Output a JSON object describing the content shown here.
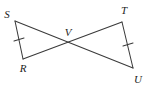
{
  "figure": {
    "type": "geometry-diagram",
    "background_color": "#ffffff",
    "stroke_color": "#3a3a3a",
    "label_color": "#1d1d1d",
    "labels": {
      "s": "S",
      "t": "T",
      "v": "V",
      "r": "R",
      "u": "U"
    },
    "points": {
      "S": {
        "x": 15,
        "y": 21
      },
      "T": {
        "x": 122,
        "y": 22
      },
      "V": {
        "x": 72,
        "y": 43
      },
      "R": {
        "x": 23,
        "y": 59
      },
      "U": {
        "x": 133,
        "y": 68
      }
    },
    "label_positions": {
      "S": {
        "x": 8,
        "y": 17
      },
      "T": {
        "x": 123,
        "y": 14
      },
      "V": {
        "x": 64,
        "y": 35
      },
      "R": {
        "x": 20,
        "y": 72
      },
      "U": {
        "x": 135,
        "y": 83
      }
    },
    "segments": [
      {
        "name": "segment-SR",
        "from": "S",
        "to": "R",
        "ticks": 1
      },
      {
        "name": "segment-TU",
        "from": "T",
        "to": "U",
        "ticks": 1
      },
      {
        "name": "segment-SU",
        "from": "S",
        "to": "U",
        "ticks": 0
      },
      {
        "name": "segment-TR",
        "from": "T",
        "to": "R",
        "ticks": 0
      }
    ],
    "tick_marks": [
      {
        "name": "tick-SR",
        "on": "segment-SR",
        "x": 19,
        "y": 40
      },
      {
        "name": "tick-TU",
        "on": "segment-TU",
        "x": 128,
        "y": 45
      }
    ]
  }
}
